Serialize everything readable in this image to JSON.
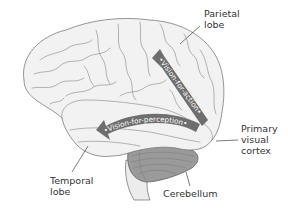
{
  "diagram": {
    "labels": {
      "parietal": "Parietal\nlobe",
      "primary_visual": "Primary\nvisual\ncortex",
      "temporal": "Temporal\nlobe",
      "cerebellum": "Cerebellum"
    },
    "streams": {
      "dorsal": "•Vision-for-action•",
      "ventral": "•Vision-for-perception•"
    },
    "colors": {
      "background": "#ffffff",
      "brain_fill": "#f2f2f2",
      "outline": "#6a6a6a",
      "arrow_fill": "#6e6e6e",
      "arrow_text": "#ffffff",
      "label_text": "#333333",
      "cerebellum_fill": "#8a8a8a"
    }
  }
}
